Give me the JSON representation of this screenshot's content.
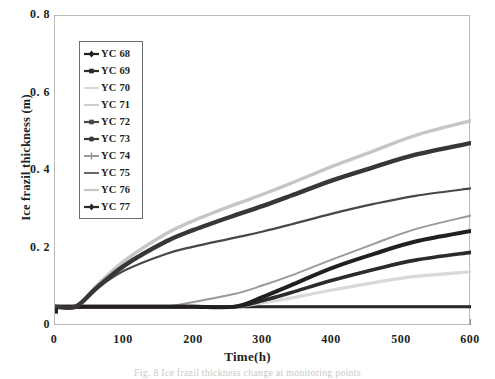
{
  "chart_data": {
    "type": "line",
    "title": "",
    "xlabel": "Time(h)",
    "ylabel": "Ice frazil thickness (m)",
    "xlim": [
      0,
      600
    ],
    "ylim": [
      0,
      0.8
    ],
    "xticks": [
      0,
      100,
      200,
      300,
      400,
      500,
      600
    ],
    "xtick_labels": [
      "0",
      "100",
      "200",
      "300",
      "400",
      "500",
      "600"
    ],
    "yticks": [
      0,
      0.2,
      0.4,
      0.6,
      0.8
    ],
    "ytick_labels": [
      "0",
      "0. 2",
      "0. 4",
      "0. 6",
      "0. 8"
    ],
    "grid": false,
    "legend_position": "upper-left-inside",
    "x": [
      0,
      30,
      60,
      100,
      160,
      200,
      260,
      300,
      340,
      400,
      460,
      520,
      600
    ],
    "series": [
      {
        "name": "YC 68",
        "color": "#231f20",
        "width": 4.0,
        "marker": "diamond",
        "values": [
          0.05,
          0.05,
          0.05,
          0.05,
          0.05,
          0.05,
          0.05,
          0.075,
          0.105,
          0.15,
          0.186,
          0.218,
          0.245
        ]
      },
      {
        "name": "YC 69",
        "color": "#2d2a2b",
        "width": 3.6,
        "marker": "square",
        "values": [
          0.05,
          0.05,
          0.05,
          0.05,
          0.05,
          0.05,
          0.05,
          0.066,
          0.086,
          0.118,
          0.146,
          0.17,
          0.19
        ]
      },
      {
        "name": "YC 70",
        "color": "#d9d9d9",
        "width": 3.2,
        "marker": "none",
        "values": [
          0.05,
          0.05,
          0.05,
          0.05,
          0.05,
          0.05,
          0.05,
          0.06,
          0.072,
          0.093,
          0.112,
          0.128,
          0.14
        ]
      },
      {
        "name": "YC 71",
        "color": "#cfcfcf",
        "width": 2.6,
        "marker": "none",
        "values": [
          0.05,
          0.05,
          0.05,
          0.05,
          0.05,
          0.05,
          0.05,
          0.05,
          0.05,
          0.05,
          0.05,
          0.05,
          0.05
        ]
      },
      {
        "name": "YC 72",
        "color": "#4a4748",
        "width": 2.2,
        "marker": "square",
        "values": [
          0.05,
          0.05,
          0.096,
          0.143,
          0.186,
          0.205,
          0.228,
          0.244,
          0.262,
          0.29,
          0.315,
          0.336,
          0.355
        ]
      },
      {
        "name": "YC 73",
        "color": "#3a3637",
        "width": 4.4,
        "marker": "circle",
        "values": [
          0.05,
          0.05,
          0.098,
          0.156,
          0.218,
          0.248,
          0.286,
          0.31,
          0.336,
          0.376,
          0.41,
          0.442,
          0.472
        ]
      },
      {
        "name": "YC 74",
        "color": "#9a9a9a",
        "width": 2.0,
        "marker": "plus",
        "values": [
          0.05,
          0.05,
          0.05,
          0.05,
          0.05,
          0.062,
          0.083,
          0.105,
          0.13,
          0.172,
          0.212,
          0.25,
          0.285
        ]
      },
      {
        "name": "YC 75",
        "color": "#585556",
        "width": 1.8,
        "marker": "none",
        "values": [
          0.05,
          0.05,
          0.05,
          0.05,
          0.05,
          0.05,
          0.05,
          0.05,
          0.05,
          0.05,
          0.05,
          0.05,
          0.05
        ]
      },
      {
        "name": "YC 76",
        "color": "#c6c6c6",
        "width": 3.4,
        "marker": "none",
        "values": [
          0.05,
          0.05,
          0.104,
          0.168,
          0.238,
          0.272,
          0.314,
          0.34,
          0.368,
          0.412,
          0.452,
          0.492,
          0.53
        ]
      },
      {
        "name": "YC 77",
        "color": "#2b2829",
        "width": 3.0,
        "marker": "diamond",
        "values": [
          0.05,
          0.05,
          0.05,
          0.05,
          0.05,
          0.05,
          0.05,
          0.05,
          0.05,
          0.05,
          0.05,
          0.05,
          0.05
        ]
      }
    ],
    "baseline_value": 0.05,
    "annotations": [
      "Flat baseline segment at 0.05 m before growth onset",
      "Growth onset times approximately 30 h, 160 h and 260 h"
    ]
  },
  "caption": {
    "text": "Fig. 8 Ice frazil thickness change at monitoring points"
  }
}
